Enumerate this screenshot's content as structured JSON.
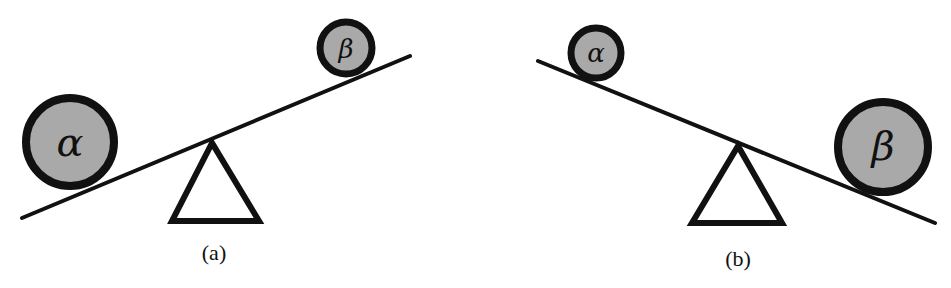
{
  "panels": [
    {
      "label": "(a)",
      "left_ball": {
        "symbol": "α",
        "size": "large"
      },
      "right_ball": {
        "symbol": "β",
        "size": "small"
      },
      "tilt": "left side down"
    },
    {
      "label": "(b)",
      "left_ball": {
        "symbol": "α",
        "size": "small"
      },
      "right_ball": {
        "symbol": "β",
        "size": "large"
      },
      "tilt": "right side down"
    }
  ],
  "colors": {
    "ball_fill": "#a9a9a9",
    "stroke": "#111111",
    "background": "#ffffff"
  }
}
